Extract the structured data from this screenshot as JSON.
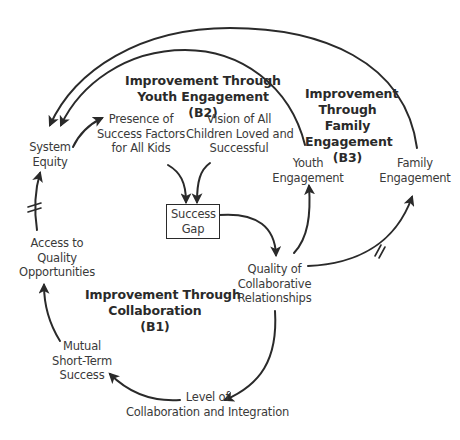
{
  "diagram": {
    "type": "causal-loop-diagram",
    "colors": {
      "line": "#2a2a2a",
      "text": "#3a3a3a",
      "background": "#ffffff"
    },
    "nodes": {
      "system_equity": {
        "lines": [
          "System",
          "Equity"
        ]
      },
      "presence_success_factors": {
        "lines": [
          "Presence of",
          "Success Factors",
          "for All Kids"
        ]
      },
      "vision_all_children": {
        "lines": [
          "Vision of All",
          "Children Loved and",
          "Successful"
        ]
      },
      "success_gap": {
        "lines": [
          "Success",
          "Gap"
        ]
      },
      "youth_engagement": {
        "lines": [
          "Youth",
          "Engagement"
        ]
      },
      "family_engagement": {
        "lines": [
          "Family",
          "Engagement"
        ]
      },
      "quality_collab_relationships": {
        "lines": [
          "Quality of",
          "Collaborative",
          "Relationships"
        ]
      },
      "access_quality_opportunities": {
        "lines": [
          "Access to",
          "Quality",
          "Opportunities"
        ]
      },
      "mutual_short_term_success": {
        "lines": [
          "Mutual",
          "Short-Term",
          "Success"
        ]
      },
      "level_collab_integration": {
        "lines": [
          "Level of",
          "Collaboration and Integration"
        ]
      }
    },
    "loops": {
      "b1": {
        "lines": [
          "Improvement Through",
          "Collaboration",
          "(B1)"
        ]
      },
      "b2": {
        "lines": [
          "Improvement Through",
          "Youth Engagement",
          "(B2)"
        ]
      },
      "b3": {
        "lines": [
          "Improvement",
          "Through",
          "Family",
          "Engagement",
          "(B3)"
        ]
      }
    },
    "links": [
      {
        "from": "Family Engagement",
        "to": "System Equity",
        "delay": false
      },
      {
        "from": "Youth Engagement",
        "to": "System Equity",
        "delay": false
      },
      {
        "from": "System Equity",
        "to": "Presence of Success Factors for All Kids",
        "delay": false
      },
      {
        "from": "Presence of Success Factors for All Kids",
        "to": "Success Gap",
        "delay": false
      },
      {
        "from": "Vision of All Children Loved and Successful",
        "to": "Success Gap",
        "delay": false
      },
      {
        "from": "Success Gap",
        "to": "Quality of Collaborative Relationships",
        "delay": false
      },
      {
        "from": "Quality of Collaborative Relationships",
        "to": "Youth Engagement",
        "delay": false
      },
      {
        "from": "Quality of Collaborative Relationships",
        "to": "Family Engagement",
        "delay": true
      },
      {
        "from": "Quality of Collaborative Relationships",
        "to": "Level of Collaboration and Integration",
        "delay": false
      },
      {
        "from": "Level of Collaboration and Integration",
        "to": "Mutual Short-Term Success",
        "delay": false
      },
      {
        "from": "Mutual Short-Term Success",
        "to": "Access to Quality Opportunities",
        "delay": false
      },
      {
        "from": "Access to Quality Opportunities",
        "to": "System Equity",
        "delay": true
      }
    ]
  }
}
